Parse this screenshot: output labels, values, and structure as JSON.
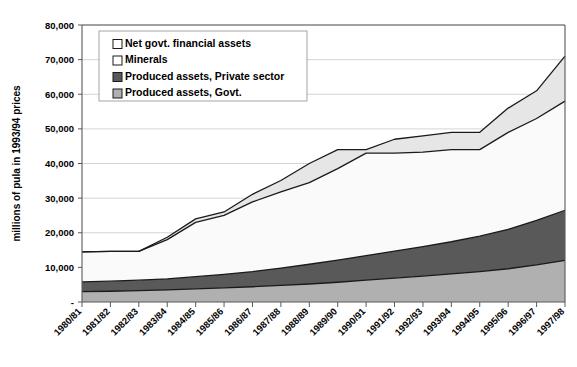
{
  "chart_data": {
    "type": "area",
    "stacked": true,
    "title": "",
    "xlabel": "",
    "ylabel": "millions of pula in 1993/94 prices",
    "ylim": [
      0,
      80000
    ],
    "ytick_values": [
      0,
      10000,
      20000,
      30000,
      40000,
      50000,
      60000,
      70000,
      80000
    ],
    "ytick_labels": [
      "-",
      "10,000",
      "20,000",
      "30,000",
      "40,000",
      "50,000",
      "60,000",
      "70,000",
      "80,000"
    ],
    "grid": true,
    "legend_position": "top-left-inside",
    "categories": [
      "1980/81",
      "1981/82",
      "1982/83",
      "1983/84",
      "1984/85",
      "1985/86",
      "1986/87",
      "1987/88",
      "1988/89",
      "1989/90",
      "1990/91",
      "1991/92",
      "1992/93",
      "1993/94",
      "1994/95",
      "1995/96",
      "1996/97",
      "1997/98"
    ],
    "series": [
      {
        "name": "Produced assets, Govt.",
        "color": "#b0b0b0",
        "values": [
          3000,
          3100,
          3300,
          3500,
          3800,
          4100,
          4400,
          4800,
          5200,
          5700,
          6300,
          6900,
          7500,
          8100,
          8800,
          9600,
          10700,
          12000
        ]
      },
      {
        "name": "Produced assets, Private sector",
        "color": "#595959",
        "values": [
          2800,
          2900,
          3000,
          3200,
          3500,
          3900,
          4400,
          5000,
          5700,
          6400,
          7100,
          7800,
          8500,
          9300,
          10200,
          11400,
          12900,
          14500
        ]
      },
      {
        "name": "Minerals",
        "color": "#fafafa",
        "values": [
          8700,
          8600,
          8300,
          11300,
          15700,
          17000,
          20100,
          22000,
          23600,
          26400,
          29600,
          28300,
          27300,
          26600,
          25000,
          28000,
          29400,
          31500
        ]
      },
      {
        "name": "Net govt. financial assets",
        "color": "#e6e6e6",
        "values": [
          0,
          0,
          0,
          700,
          1000,
          1000,
          2200,
          3300,
          5500,
          5500,
          1000,
          4000,
          4700,
          5000,
          5000,
          7000,
          8000,
          13000
        ]
      }
    ],
    "cumulative_tops": {
      "produced_govt": [
        3000,
        3100,
        3300,
        3500,
        3800,
        4100,
        4400,
        4800,
        5200,
        5700,
        6300,
        6900,
        7500,
        8100,
        8800,
        9600,
        10700,
        12000
      ],
      "produced_private": [
        5800,
        6000,
        6300,
        6700,
        7300,
        8000,
        8800,
        9800,
        10900,
        12100,
        13400,
        14700,
        16000,
        17400,
        19000,
        21000,
        23600,
        26500
      ],
      "minerals": [
        14500,
        14600,
        14600,
        18000,
        23000,
        25000,
        28900,
        31800,
        34500,
        38500,
        43000,
        43000,
        43300,
        44000,
        44000,
        49000,
        53000,
        58000
      ],
      "total": [
        14500,
        14600,
        14600,
        18700,
        24000,
        26000,
        31100,
        35100,
        40000,
        44000,
        44000,
        47000,
        48000,
        49000,
        49000,
        56000,
        61000,
        71000
      ]
    },
    "legend": [
      {
        "label": "Net govt. financial assets",
        "swatch": "#ffffff"
      },
      {
        "label": "Minerals",
        "swatch": "#ffffff"
      },
      {
        "label": "Produced assets, Private sector",
        "swatch": "#595959"
      },
      {
        "label": "Produced assets, Govt.",
        "swatch": "#b0b0b0"
      }
    ]
  }
}
